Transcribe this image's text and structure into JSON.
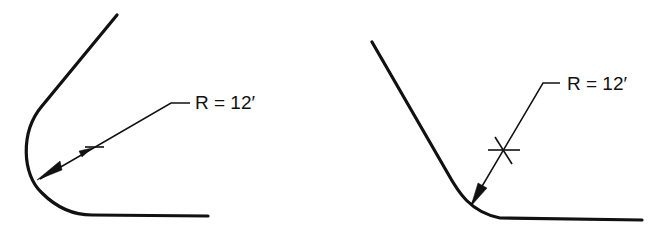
{
  "figures": [
    {
      "name": "left-curve",
      "label": "R = 12′",
      "description": "Tangent curve with radius dimension, center mark near arc"
    },
    {
      "name": "right-curve",
      "label": "R = 12′",
      "description": "Tangent curve with radius dimension, center mark farther from arc"
    }
  ],
  "colors": {
    "line": "#111111",
    "background": "#ffffff"
  }
}
